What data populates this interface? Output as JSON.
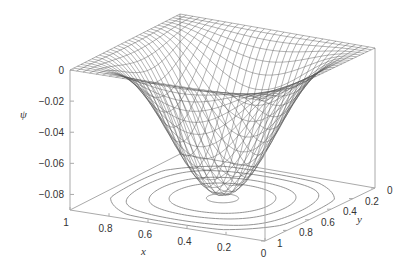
{
  "chart_data": {
    "type": "surface3d",
    "title": "",
    "function": "psi(x,y) = -0.09 * sin(pi*x)^2 * sin(pi*y)^2 (approx. shape, minimum near x=0.5,y=0.5)",
    "xlabel": "x",
    "ylabel": "y",
    "zlabel": "ψ",
    "xlim": [
      0,
      1
    ],
    "ylim": [
      0,
      1
    ],
    "zlim": [
      -0.09,
      0
    ],
    "x_ticks": [
      "1",
      "0.8",
      "0.6",
      "0.4",
      "0.2",
      "0"
    ],
    "y_ticks": [
      "0",
      "0.2",
      "0.4",
      "0.6",
      "0.8",
      "1"
    ],
    "z_ticks": [
      "0",
      "-0.02",
      "-0.04",
      "-0.06",
      "-0.08"
    ],
    "z_min_value": -0.088,
    "grid_resolution": 30,
    "contours_on_base": true,
    "contour_count": 5,
    "mesh_color": "#555555",
    "axis_color": "#aaaaaa",
    "contour_color": "#888888"
  },
  "labels": {
    "zlabel": "ψ",
    "xlabel": "x",
    "ylabel": "y"
  }
}
